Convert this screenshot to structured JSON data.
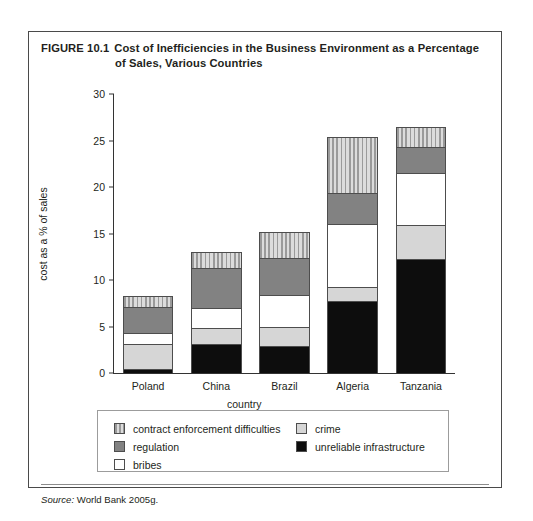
{
  "figure": {
    "number_label": "FIGURE 10.1",
    "title": "Cost of Inefficiencies in the Business Environment as a Percentage of Sales, Various Countries",
    "source_keyword": "Source:",
    "source_text": "World Bank 2005g."
  },
  "chart_data": {
    "type": "bar",
    "stacked": true,
    "title": "Cost of Inefficiencies in the Business Environment as a Percentage of Sales, Various Countries",
    "xlabel": "country",
    "ylabel": "cost as a % of sales",
    "categories": [
      "Poland",
      "China",
      "Brazil",
      "Algeria",
      "Tanzania"
    ],
    "ylim": [
      0,
      30
    ],
    "yticks": [
      0,
      5,
      10,
      15,
      20,
      25,
      30
    ],
    "grid": false,
    "legend_position": "below-plot",
    "series": [
      {
        "name": "unreliable infrastructure",
        "color": "#0d0d0d",
        "swatch": "solid-black",
        "values": [
          0.3,
          3.0,
          2.8,
          7.7,
          12.2
        ]
      },
      {
        "name": "crime",
        "color": "#d6d6d6",
        "swatch": "solid-light-gray",
        "values": [
          2.8,
          1.8,
          2.1,
          1.5,
          3.7
        ]
      },
      {
        "name": "bribes",
        "color": "#ffffff",
        "swatch": "solid-white",
        "values": [
          1.1,
          2.1,
          3.4,
          6.8,
          5.6
        ]
      },
      {
        "name": "regulation",
        "color": "#828282",
        "swatch": "solid-dark-gray",
        "values": [
          2.9,
          4.4,
          4.1,
          3.3,
          2.8
        ]
      },
      {
        "name": "contract enforcement difficulties",
        "color": "#bdbdbd",
        "swatch": "vertical-hatch",
        "values": [
          1.2,
          1.7,
          2.8,
          6.1,
          2.2
        ]
      }
    ],
    "totals": [
      8.3,
      13.0,
      15.2,
      25.4,
      26.5
    ]
  },
  "legend": {
    "left_column": [
      {
        "label": "contract enforcement difficulties",
        "swatch": "vertical-hatch"
      },
      {
        "label": "regulation",
        "swatch": "solid-dark-gray"
      },
      {
        "label": "bribes",
        "swatch": "solid-white"
      }
    ],
    "right_column": [
      {
        "label": "crime",
        "swatch": "solid-light-gray"
      },
      {
        "label": "unreliable infrastructure",
        "swatch": "solid-black"
      }
    ]
  }
}
